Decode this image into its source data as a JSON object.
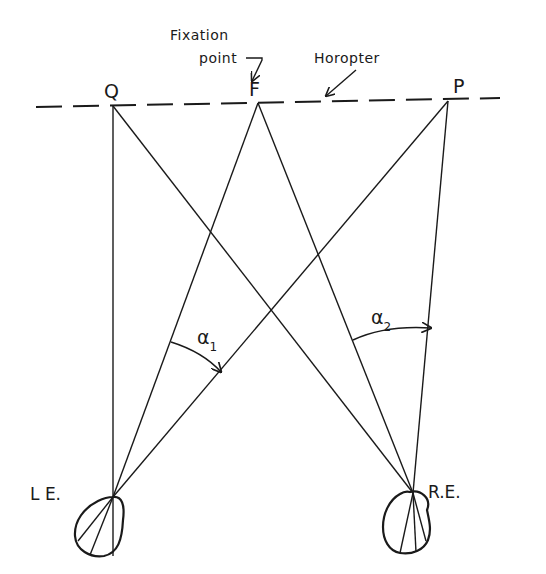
{
  "diagram": {
    "points": {
      "Q": "Q",
      "F": "F",
      "P": "P"
    },
    "annotations": {
      "fixation_line1": "Fixation",
      "fixation_line2": "point",
      "horopter": "Horopter"
    },
    "eyes": {
      "left": "L E.",
      "right": "R.E."
    },
    "angles": {
      "alpha1_symbol": "α",
      "alpha1_sub": "1",
      "alpha2_symbol": "α",
      "alpha2_sub": "2"
    },
    "colors": {
      "ink": "#1a1a1a",
      "background": "#ffffff"
    }
  }
}
